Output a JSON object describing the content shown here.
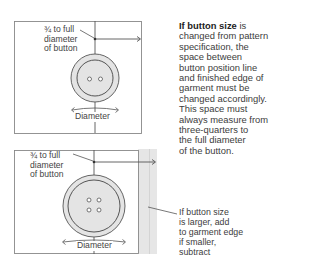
{
  "top_diagram": {
    "label_distance": [
      "¾ to full",
      "diameter",
      "of button"
    ],
    "label_diameter": "Diameter",
    "button_holes": 2
  },
  "bottom_diagram": {
    "label_distance": [
      "¾ to full",
      "diameter",
      "of button"
    ],
    "label_diameter": "Diameter",
    "button_holes": 4
  },
  "main_note": {
    "bold_lead": "If button size",
    "rest": " is changed from pattern specification, the space between button position line and finished edge of garment must be changed accordingly. This space must always measure from three-quarters to the full diameter of the button.",
    "lines": [
      "changed from pattern",
      "specification, the",
      "space between",
      "button position line",
      "and finished edge of",
      "garment must be",
      "changed accordingly.",
      "This space must",
      "always measure from",
      "three-quarters to",
      "the full diameter",
      "of the button."
    ],
    "first_line_rest": " is"
  },
  "side_note": {
    "lines": [
      "If button size",
      "is larger, add",
      "to garment edge",
      "if smaller,",
      "subtract"
    ]
  },
  "colors": {
    "line": "#555555",
    "button_fill": "#e4e4e4",
    "garment_band": "#e6e6e6"
  }
}
